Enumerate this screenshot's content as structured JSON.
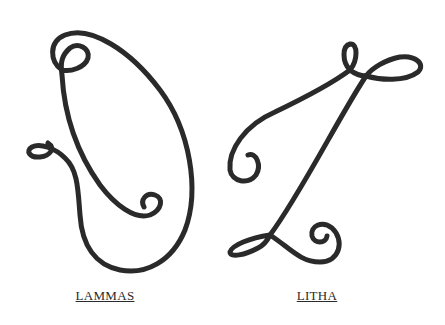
{
  "figures": [
    {
      "name": "lammas",
      "label": "LAMMAS"
    },
    {
      "name": "litha",
      "label": "LITHA"
    }
  ],
  "colors": {
    "background": "#ffffff",
    "stroke": "#2a2a2a",
    "label": "#2a2a2a"
  }
}
